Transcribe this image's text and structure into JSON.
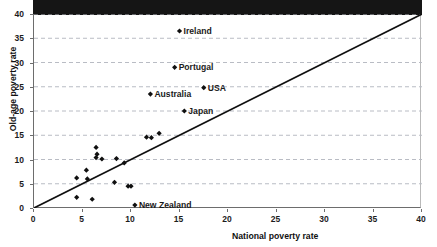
{
  "chart_data": {
    "type": "scatter",
    "title": "",
    "xlabel": "National poverty rate",
    "ylabel": "Old-age poverty rate",
    "xlim": [
      0,
      40
    ],
    "ylim": [
      0,
      40
    ],
    "xticks": [
      0,
      5,
      10,
      15,
      20,
      25,
      30,
      35,
      40
    ],
    "yticks": [
      0,
      5,
      10,
      15,
      20,
      25,
      30,
      35,
      40
    ],
    "grid": "horizontal-dashed",
    "legend": "none",
    "reference_line": {
      "name": "45-degree equality line",
      "from": [
        0,
        0
      ],
      "to": [
        40,
        40
      ]
    },
    "points": [
      {
        "x": 15.0,
        "y": 36.5,
        "label": "Ireland"
      },
      {
        "x": 14.5,
        "y": 29.0,
        "label": "Portugal"
      },
      {
        "x": 12.0,
        "y": 23.5,
        "label": "Australia"
      },
      {
        "x": 17.5,
        "y": 24.8,
        "label": "USA"
      },
      {
        "x": 15.5,
        "y": 20.0,
        "label": "Japan"
      },
      {
        "x": 10.4,
        "y": 0.6,
        "label": "New Zealand"
      },
      {
        "x": 12.9,
        "y": 15.4,
        "label": ""
      },
      {
        "x": 11.6,
        "y": 14.6,
        "label": ""
      },
      {
        "x": 12.1,
        "y": 14.5,
        "label": ""
      },
      {
        "x": 6.4,
        "y": 12.5,
        "label": ""
      },
      {
        "x": 6.5,
        "y": 11.1,
        "label": ""
      },
      {
        "x": 6.4,
        "y": 10.4,
        "label": ""
      },
      {
        "x": 7.0,
        "y": 10.1,
        "label": ""
      },
      {
        "x": 8.5,
        "y": 10.2,
        "label": ""
      },
      {
        "x": 9.3,
        "y": 9.3,
        "label": ""
      },
      {
        "x": 5.4,
        "y": 7.8,
        "label": ""
      },
      {
        "x": 4.4,
        "y": 6.2,
        "label": ""
      },
      {
        "x": 5.5,
        "y": 6.0,
        "label": ""
      },
      {
        "x": 8.3,
        "y": 5.3,
        "label": ""
      },
      {
        "x": 9.7,
        "y": 4.5,
        "label": ""
      },
      {
        "x": 10.0,
        "y": 4.5,
        "label": ""
      },
      {
        "x": 4.4,
        "y": 2.2,
        "label": ""
      },
      {
        "x": 6.0,
        "y": 1.8,
        "label": ""
      }
    ]
  }
}
